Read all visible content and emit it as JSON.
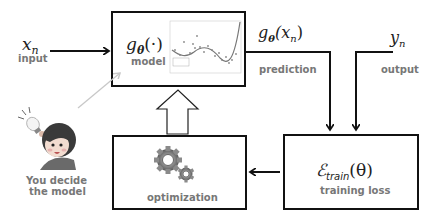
{
  "diagram": {
    "input": {
      "symbol": "x",
      "subscript": "n",
      "label": "input"
    },
    "model": {
      "symbol": "g",
      "theta": "θ",
      "arg": "(·)",
      "label": "model"
    },
    "prediction": {
      "symbol": "g",
      "theta": "θ",
      "arg_open": "(x",
      "arg_sub": "n",
      "arg_close": ")",
      "label": "prediction"
    },
    "output": {
      "symbol": "y",
      "subscript": "n",
      "label": "output"
    },
    "loss": {
      "symbol": "ℰ",
      "subscript": "train",
      "arg": "(θ)",
      "label": "training loss"
    },
    "optimization": {
      "label": "optimization",
      "icon": "gears-icon"
    },
    "user": {
      "label_line1": "You decide",
      "label_line2": "the model",
      "icon": "person-with-idea-icon"
    }
  },
  "colors": {
    "stroke": "#111111",
    "label": "#777777",
    "hint_arrow": "#c8c8c8",
    "gear": "#808080"
  }
}
